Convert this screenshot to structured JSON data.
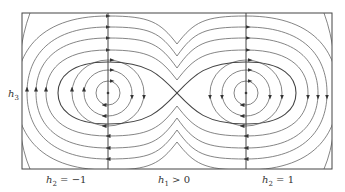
{
  "diagram": {
    "type": "phase-portrait",
    "y_axis_label": {
      "var": "h",
      "sub": "3"
    },
    "x_labels": [
      {
        "var": "h",
        "sub": "2",
        "rest": " = −1"
      },
      {
        "var": "h",
        "sub": "1",
        "rest": " > 0"
      },
      {
        "var": "h",
        "sub": "2",
        "rest": " = 1"
      }
    ],
    "fixed_points": [
      {
        "kind": "center",
        "x": 108,
        "y": 93
      },
      {
        "kind": "saddle",
        "x": 177,
        "y": 93
      },
      {
        "kind": "center",
        "x": 246,
        "y": 93
      }
    ],
    "line_color": "#555555",
    "frame_color": "#444444"
  }
}
